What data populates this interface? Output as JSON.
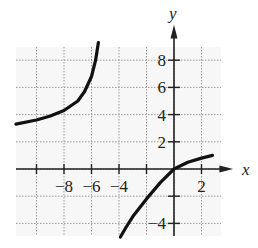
{
  "chart_data": {
    "type": "line",
    "title": "",
    "xlabel": "x",
    "ylabel": "y",
    "xlim": [
      -11.5,
      3
    ],
    "ylim": [
      -5,
      9.5
    ],
    "grid": true,
    "grid_spacing": 2,
    "x_ticks": [
      -8,
      -6,
      -4,
      2
    ],
    "y_ticks": [
      8,
      6,
      4,
      2,
      -4
    ],
    "x_tick_labels": [
      "−8",
      "−6",
      "−4",
      "2"
    ],
    "y_tick_labels": [
      "8",
      "6",
      "4",
      "2",
      "−4"
    ],
    "vertical_asymptote": -5,
    "series": [
      {
        "name": "left branch",
        "x": [
          -11.5,
          -10,
          -9,
          -8,
          -7,
          -6.5,
          -6,
          -5.7,
          -5.5
        ],
        "y": [
          3.3,
          3.6,
          3.9,
          4.3,
          5.0,
          5.7,
          6.8,
          8.0,
          9.3
        ]
      },
      {
        "name": "right branch",
        "x": [
          -3.9,
          -3.5,
          -3,
          -2,
          -1,
          0,
          1,
          2,
          2.8
        ],
        "y": [
          -5.0,
          -4.3,
          -3.5,
          -2.2,
          -1.0,
          0,
          0.5,
          0.8,
          1.0
        ]
      }
    ]
  }
}
